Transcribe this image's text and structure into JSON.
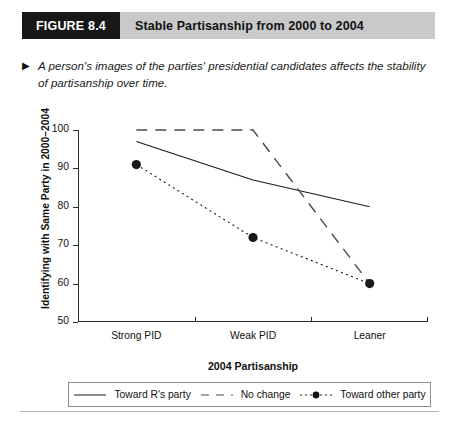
{
  "figure": {
    "tag": "FIGURE 8.4",
    "title": "Stable Partisanship from 2000 to 2004",
    "tag_bg": "#171717",
    "title_bg": "#c9c9c9"
  },
  "caption": {
    "marker": "▶",
    "text": "A person's images of the parties' presidential candidates affects the stability of partisanship over time."
  },
  "chart_data": {
    "type": "line",
    "title": "Stable Partisanship from 2000 to 2004",
    "xlabel": "2004 Partisanship",
    "ylabel": "Identifying with Same Party in 2000–2004",
    "categories": [
      "Strong PID",
      "Weak PID",
      "Leaner"
    ],
    "ylim": [
      50,
      100
    ],
    "yticks": [
      50,
      60,
      70,
      80,
      90,
      100
    ],
    "grid": false,
    "legend_position": "below",
    "series": [
      {
        "name": "Toward R's party",
        "values": [
          97,
          87,
          80
        ],
        "style": "solid",
        "marker": "none",
        "color": "#1a1a1a"
      },
      {
        "name": "No change",
        "values": [
          100,
          100,
          60
        ],
        "style": "dashed",
        "marker": "none",
        "color": "#4a4a4a"
      },
      {
        "name": "Toward other party",
        "values": [
          91,
          72,
          60
        ],
        "style": "dotted",
        "marker": "filled-circle",
        "color": "#1a1a1a"
      }
    ]
  },
  "legend": {
    "items": [
      {
        "label": "Toward R's party",
        "swatch": "solid-line-swatch"
      },
      {
        "label": "No change",
        "swatch": "dashed-line-swatch"
      },
      {
        "label": "Toward other party",
        "swatch": "dotted-line-marker-swatch"
      }
    ]
  }
}
